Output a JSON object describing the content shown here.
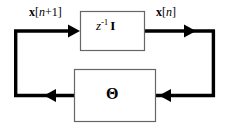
{
  "diagram": {
    "stroke_color": "#000000",
    "box_border_color": "#555555",
    "background_color": "#ffffff",
    "blocks": [
      {
        "id": "delay-block",
        "name": "unit-delay-block",
        "expression": {
          "base": "z",
          "exponent": "-1",
          "matrix": "I"
        }
      },
      {
        "id": "theta-block",
        "name": "theta-block",
        "symbol": "Θ"
      }
    ],
    "signals": [
      {
        "id": "x-next",
        "name": "state-next-label",
        "vector": "x",
        "open_bracket": "[",
        "index": "n",
        "offset": "+1",
        "close_bracket": "]"
      },
      {
        "id": "x-now",
        "name": "state-current-label",
        "vector": "x",
        "open_bracket": "[",
        "index": "n",
        "offset": "",
        "close_bracket": "]"
      }
    ],
    "arrows": [
      {
        "id": "arrow-into-delay",
        "direction": "right"
      },
      {
        "id": "arrow-out-of-delay",
        "direction": "right"
      },
      {
        "id": "arrow-into-theta",
        "direction": "left"
      },
      {
        "id": "arrow-out-of-theta",
        "direction": "left"
      }
    ]
  }
}
